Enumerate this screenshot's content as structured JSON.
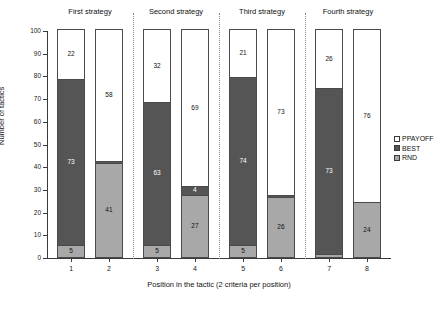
{
  "chart_data": {
    "type": "bar",
    "subtype": "stacked-column",
    "title": "",
    "xlabel": "Position in the tactic (2 criteria per position)",
    "ylabel": "Number of tactics",
    "ylim": [
      0,
      100
    ],
    "yticks": [
      0,
      10,
      20,
      30,
      40,
      50,
      60,
      70,
      80,
      90,
      100
    ],
    "grid": false,
    "legend_position": "right",
    "categories": [
      "1",
      "2",
      "3",
      "4",
      "5",
      "6",
      "7",
      "8"
    ],
    "panels": [
      {
        "label": "First strategy",
        "positions": [
          "1",
          "2"
        ]
      },
      {
        "label": "Second strategy",
        "positions": [
          "3",
          "4"
        ]
      },
      {
        "label": "Third strategy",
        "positions": [
          "5",
          "6"
        ]
      },
      {
        "label": "Fourth strategy",
        "positions": [
          "7",
          "8"
        ]
      }
    ],
    "series": [
      {
        "name": "RND",
        "color": "#a8a8a8",
        "values": [
          5,
          41,
          5,
          27,
          5,
          26,
          1,
          24
        ]
      },
      {
        "name": "BEST",
        "color": "#555555",
        "values": [
          73,
          1,
          63,
          4,
          74,
          1,
          73,
          0
        ]
      },
      {
        "name": "PPAYOFF",
        "color": "#ffffff",
        "values": [
          22,
          58,
          32,
          69,
          21,
          73,
          26,
          76
        ]
      }
    ],
    "bar_labels": [
      {
        "position": "1",
        "rnd": "5",
        "best": "73",
        "ppayoff": "22"
      },
      {
        "position": "2",
        "rnd": "41",
        "best": "",
        "ppayoff": "58"
      },
      {
        "position": "3",
        "rnd": "5",
        "best": "63",
        "ppayoff": "32"
      },
      {
        "position": "4",
        "rnd": "27",
        "best": "4",
        "ppayoff": "69"
      },
      {
        "position": "5",
        "rnd": "5",
        "best": "74",
        "ppayoff": "21"
      },
      {
        "position": "6",
        "rnd": "26",
        "best": "",
        "ppayoff": "73"
      },
      {
        "position": "7",
        "rnd": "",
        "best": "73",
        "ppayoff": "26"
      },
      {
        "position": "8",
        "rnd": "24",
        "best": "",
        "ppayoff": "76"
      }
    ]
  },
  "legend": {
    "items": [
      {
        "label": "PPAYOFF",
        "swatch": "ppay"
      },
      {
        "label": "BEST",
        "swatch": "best"
      },
      {
        "label": "RND",
        "swatch": "rnd"
      }
    ]
  }
}
